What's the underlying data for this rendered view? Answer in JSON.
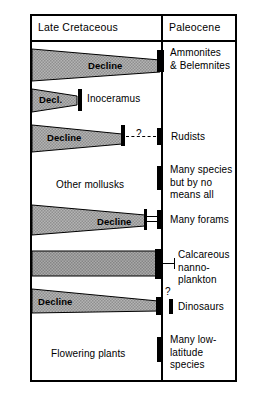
{
  "figure": {
    "columns": {
      "left_header": "Late Cretaceous",
      "right_header": "Paleocene"
    },
    "rows": [
      {
        "id": "ammonites",
        "left_label": "Decline",
        "left_kind": "wedge",
        "right_label": "Ammonites\n& Belemnites",
        "uncertain": false
      },
      {
        "id": "inoceramus",
        "left_label": "Decl.",
        "left_kind": "wedge-short",
        "right_label": "Inoceramus",
        "uncertain": false
      },
      {
        "id": "rudists",
        "left_label": "Decline",
        "left_kind": "wedge-short",
        "right_label": "Rudists",
        "uncertain": true,
        "uncertain_marker": "?"
      },
      {
        "id": "other-mollusks",
        "left_label": "Other mollusks",
        "left_kind": "text",
        "right_label": "Many species\nbut by no\nmeans all",
        "uncertain": false
      },
      {
        "id": "forams",
        "left_label": "Decline",
        "left_kind": "wedge",
        "right_label": "Many forams",
        "uncertain": false
      },
      {
        "id": "nannoplankton",
        "left_label": "",
        "left_kind": "bar",
        "right_label": "Calcareous\nnanno-\nplankton",
        "uncertain": false
      },
      {
        "id": "dinosaurs",
        "left_label": "Decline",
        "left_kind": "wedge",
        "right_label": "Dinosaurs",
        "uncertain": true,
        "uncertain_marker": "?"
      },
      {
        "id": "flowering-plants",
        "left_label": "Flowering plants",
        "left_kind": "text",
        "right_label": "Many low-\nlatitude\nspecies",
        "uncertain": false
      }
    ],
    "colors": {
      "ink": "#000000",
      "paper": "#ffffff",
      "band_fill": "#a8a8a8",
      "band_fill_light": "#bdbdbd"
    }
  }
}
